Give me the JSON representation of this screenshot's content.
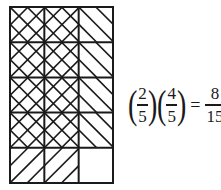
{
  "diagram": {
    "columns": 3,
    "rows": 5,
    "grid": {
      "left": 10,
      "top": 7,
      "width": 103,
      "height": 176
    },
    "stroke_color": "#1a1a1a",
    "cells": [
      [
        "cross",
        "cross",
        "back"
      ],
      [
        "cross",
        "cross",
        "back"
      ],
      [
        "cross",
        "cross",
        "back"
      ],
      [
        "cross",
        "cross",
        "back"
      ],
      [
        "fwd",
        "fwd",
        "empty"
      ]
    ],
    "legend": {
      "cross": "overlap of both fractions (shaded both directions)",
      "back": "shaded by 4/5 only",
      "fwd": "shaded by 2/3 only",
      "empty": "unshaded"
    }
  },
  "equation": {
    "factor1": {
      "numerator": "2",
      "denominator": "5"
    },
    "factor2": {
      "numerator": "4",
      "denominator": "5"
    },
    "equals": "=",
    "result": {
      "numerator": "8",
      "denominator": "15"
    },
    "open_paren": "(",
    "close_paren": ")"
  }
}
